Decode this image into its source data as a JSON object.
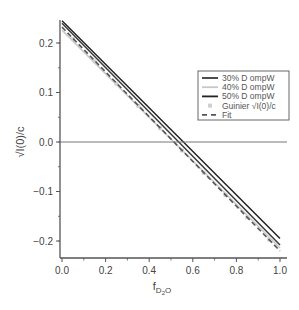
{
  "chart_data": {
    "type": "line",
    "title": "",
    "xlabel": "f_D2O",
    "xlabel_main": "f",
    "xlabel_sub": "D",
    "xlabel_subsub": "2",
    "xlabel_sub_tail": "O",
    "ylabel": "√I(0)/c",
    "xlim": [
      0.0,
      1.0
    ],
    "ylim": [
      -0.23,
      0.25
    ],
    "x_ticks": [
      "0.0",
      "0.2",
      "0.4",
      "0.6",
      "0.8",
      "1.0"
    ],
    "y_ticks": [
      "0.2",
      "0.1",
      "0.0",
      "-0.1",
      "-0.2"
    ],
    "grid": false,
    "zero_line": true,
    "legend_position": "upper right",
    "series": [
      {
        "name": "30% D ompW",
        "style": "solid",
        "color": "#3a3a3a",
        "x": [
          0.0,
          1.0
        ],
        "values": [
          0.24,
          -0.208
        ]
      },
      {
        "name": "40% D ompW",
        "style": "solid",
        "color": "#c8c8c8",
        "x": [
          0.0,
          1.0
        ],
        "values": [
          0.226,
          -0.214
        ]
      },
      {
        "name": "50% D ompW",
        "style": "solid",
        "color": "#222222",
        "x": [
          0.0,
          1.0
        ],
        "values": [
          0.245,
          -0.195
        ]
      },
      {
        "name": "Guinier √I(0)/c",
        "style": "markers",
        "color": "#d0d0d0",
        "x": [
          0.05,
          0.15,
          0.25,
          0.35,
          0.45,
          0.55,
          0.65,
          0.75,
          0.85,
          0.95
        ],
        "values": [
          0.208,
          0.163,
          0.118,
          0.073,
          0.028,
          -0.017,
          -0.062,
          -0.107,
          -0.152,
          -0.197
        ]
      },
      {
        "name": "Fit",
        "style": "dashed",
        "color": "#555555",
        "x": [
          0.0,
          1.0
        ],
        "values": [
          0.232,
          -0.22
        ]
      }
    ]
  },
  "legend": {
    "items": [
      {
        "label": "30% D ompW",
        "kind": "line",
        "color": "#3a3a3a"
      },
      {
        "label": "40% D ompW",
        "kind": "line",
        "color": "#c8c8c8"
      },
      {
        "label": "50% D ompW",
        "kind": "line",
        "color": "#222222"
      },
      {
        "label": "Guinier √I(0)/c",
        "kind": "marker",
        "color": "#d0d0d0"
      },
      {
        "label": "Fit",
        "kind": "dashed",
        "color": "#555555"
      }
    ]
  }
}
